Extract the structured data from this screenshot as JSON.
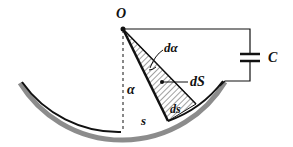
{
  "diagram": {
    "labels": {
      "origin": "O",
      "d_alpha": "dα",
      "d_S_area": "dS",
      "d_s_arc": "ds",
      "alpha": "α",
      "s": "s",
      "capacitor": "C"
    },
    "colors": {
      "line": "#111111",
      "plate": "#8a8a8a",
      "plate_inner": "#1a1a1a",
      "hatch": "#333333"
    }
  }
}
